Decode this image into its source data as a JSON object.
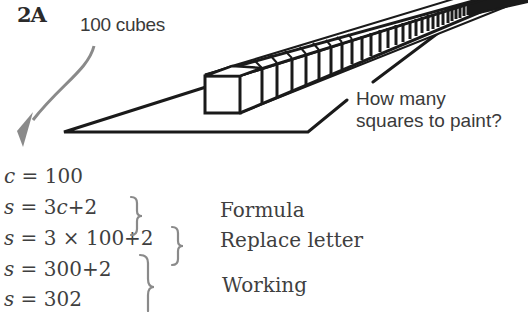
{
  "figure": {
    "label": "2A",
    "cubes_label": "100 cubes",
    "question_line1": "How many",
    "question_line2": "squares to paint?"
  },
  "equations": [
    {
      "var": "c",
      "rhs": " = 100"
    },
    {
      "var": "s",
      "rhs_prefix": " = 3",
      "inner_var": "c",
      "rhs_suffix": "+2"
    },
    {
      "var": "s",
      "rhs": " = 3 × 100+2"
    },
    {
      "var": "s",
      "rhs": " = 300+2"
    },
    {
      "var": "s",
      "rhs": " = 302"
    }
  ],
  "annotations": {
    "formula": "Formula",
    "replace": "Replace letter",
    "working": "Working"
  },
  "colors": {
    "ink": "#1a1a1a",
    "text": "#3f3f3f",
    "arrow": "#8a8a8a"
  }
}
